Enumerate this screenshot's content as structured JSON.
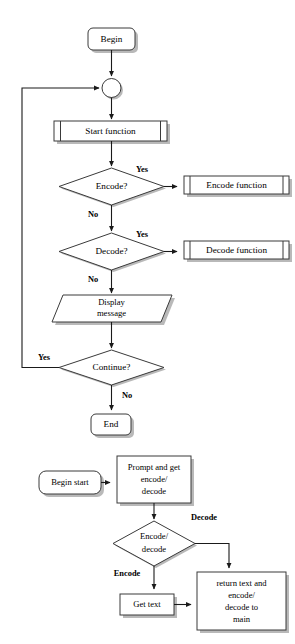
{
  "diagram": {
    "colors": {
      "background": "#ffffff",
      "node_fill": "#ffffff",
      "node_stroke": "#3a3a3a",
      "shadow": "#b9b9b9",
      "line": "#1a1a1a",
      "text": "#000000"
    },
    "charts": [
      {
        "name": "main-flowchart",
        "nodes": [
          {
            "id": "begin",
            "type": "terminator",
            "label": "Begin"
          },
          {
            "id": "connector",
            "type": "connector",
            "label": ""
          },
          {
            "id": "start-function",
            "type": "predefined-process",
            "label": "Start function"
          },
          {
            "id": "encode-decision",
            "type": "decision",
            "label": "Encode?"
          },
          {
            "id": "encode-function",
            "type": "predefined-process",
            "label": "Encode function"
          },
          {
            "id": "decode-decision",
            "type": "decision",
            "label": "Decode?"
          },
          {
            "id": "decode-function",
            "type": "predefined-process",
            "label": "Decode function"
          },
          {
            "id": "display-message",
            "type": "input-output",
            "label_line1": "Display",
            "label_line2": "message"
          },
          {
            "id": "continue-decision",
            "type": "decision",
            "label": "Continue?"
          },
          {
            "id": "end",
            "type": "terminator",
            "label": "End"
          }
        ],
        "edges": [
          {
            "from": "begin",
            "to": "connector",
            "label": ""
          },
          {
            "from": "connector",
            "to": "start-function",
            "label": ""
          },
          {
            "from": "start-function",
            "to": "encode-decision",
            "label": ""
          },
          {
            "from": "encode-decision",
            "to": "encode-function",
            "label": "Yes"
          },
          {
            "from": "encode-decision",
            "to": "decode-decision",
            "label": "No"
          },
          {
            "from": "decode-decision",
            "to": "decode-function",
            "label": "Yes"
          },
          {
            "from": "decode-decision",
            "to": "display-message",
            "label": "No"
          },
          {
            "from": "display-message",
            "to": "continue-decision",
            "label": ""
          },
          {
            "from": "continue-decision",
            "to": "connector",
            "label": "Yes"
          },
          {
            "from": "continue-decision",
            "to": "end",
            "label": "No"
          }
        ]
      },
      {
        "name": "start-function-subchart",
        "nodes": [
          {
            "id": "begin-start",
            "type": "terminator",
            "label": "Begin start"
          },
          {
            "id": "prompt-get",
            "type": "process",
            "label_line1": "Prompt and get",
            "label_line2": "encode/",
            "label_line3": "decode"
          },
          {
            "id": "ed-decision",
            "type": "decision",
            "label_line1": "Encode/",
            "label_line2": "decode"
          },
          {
            "id": "get-text",
            "type": "process",
            "label": "Get text"
          },
          {
            "id": "return-main",
            "type": "process",
            "label_line1": "return text and",
            "label_line2": "encode/",
            "label_line3": "decode to",
            "label_line4": "main"
          }
        ],
        "edges": [
          {
            "from": "begin-start",
            "to": "prompt-get",
            "label": ""
          },
          {
            "from": "prompt-get",
            "to": "ed-decision",
            "label": ""
          },
          {
            "from": "ed-decision",
            "to": "return-main",
            "label": "Decode"
          },
          {
            "from": "ed-decision",
            "to": "get-text",
            "label": "Encode"
          },
          {
            "from": "get-text",
            "to": "return-main",
            "label": ""
          }
        ]
      }
    ]
  }
}
